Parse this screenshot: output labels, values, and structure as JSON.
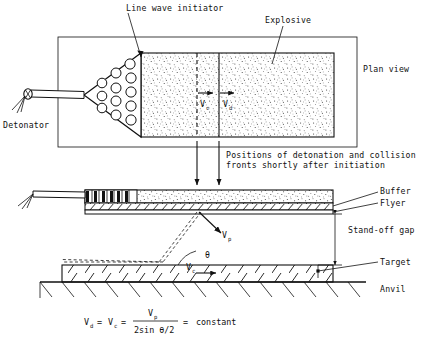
{
  "figure": {
    "type": "technical-diagram",
    "views": [
      "plan view",
      "side elevation"
    ]
  },
  "labels": {
    "line_wave_initiator": "Line wave initiator",
    "explosive": "Explosive",
    "plan_view": "Plan view",
    "detonator": "Detonator",
    "positions_caption_line1": "Positions of detonation and collision",
    "positions_caption_line2": "fronts shortly after initiation",
    "buffer": "Buffer",
    "flyer": "Flyer",
    "standoff_gap": "Stand-off gap",
    "target": "Target",
    "anvil": "Anvil"
  },
  "velocity_labels": {
    "vc_plan_main": "V",
    "vc_plan_sub": "c",
    "vd_plan_main": "V",
    "vd_plan_sub": "d",
    "vp_side_main": "V",
    "vp_side_sub": "p",
    "vc_side_main": "V",
    "vc_side_sub": "c",
    "theta": "θ"
  },
  "formula": {
    "lhs_v": "V",
    "lhs_sub": "d",
    "eq1": "=",
    "mid_v": "V",
    "mid_sub": "c",
    "eq2": "=",
    "numerator_v": "V",
    "numerator_sub": "p",
    "denominator": "2sin θ/2",
    "eq3": "=",
    "rhs": "constant",
    "plain_text": "V_d = V_c = V_p / (2sin θ/2) = constant"
  },
  "colors": {
    "ink": "#111111",
    "paper": "#ffffff"
  },
  "geometry": {
    "initiator_circle_count": 12,
    "plan_frame": {
      "x": 58,
      "y": 37,
      "w": 299,
      "h": 110
    },
    "explosive_block": {
      "x": 141,
      "y": 53,
      "w": 193,
      "h": 84
    },
    "collision_front_x": 197,
    "detonation_front_x": 219
  }
}
